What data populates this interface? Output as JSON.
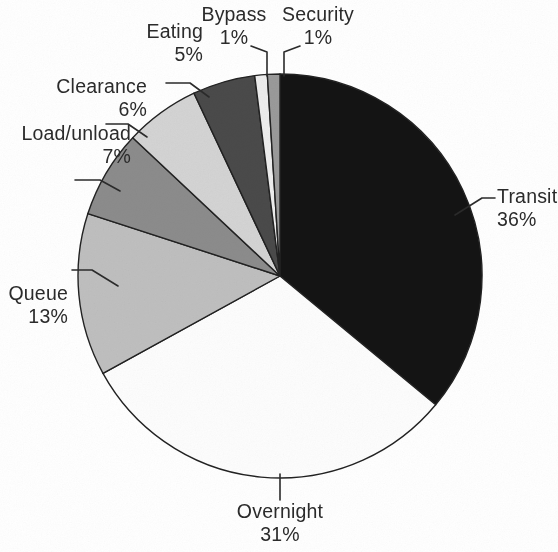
{
  "figure": {
    "type": "pie-chart-figure",
    "background_color": "#ffffff",
    "outline_color": "#222222"
  },
  "chart_data": {
    "type": "pie",
    "title": "",
    "subtitle": "",
    "xlabel": "",
    "ylabel": "",
    "legend_position": "none",
    "grid": false,
    "units": "percent",
    "start_angle_deg": 0,
    "direction": "clockwise",
    "total": 100,
    "categories": [
      "Transit",
      "Overnight",
      "Queue",
      "Load/unload",
      "Clearance",
      "Eating",
      "Bypass",
      "Security"
    ],
    "values": [
      36,
      31,
      13,
      7,
      6,
      5,
      1,
      1
    ],
    "slices": [
      {
        "label": "Transit",
        "value": 36,
        "value_text": "36%",
        "color": "#141414",
        "start_deg": 0,
        "end_deg": 129.6,
        "label_position": "right",
        "label_x": 496,
        "label_y": 198
      },
      {
        "label": "Overnight",
        "value": 31,
        "value_text": "31%",
        "color": "#fdfdfd",
        "start_deg": 129.6,
        "end_deg": 241.2,
        "label_position": "bottom",
        "label_x": 280,
        "label_y": 505
      },
      {
        "label": "Queue",
        "value": 13,
        "value_text": "13%",
        "color": "#bfbfbf",
        "start_deg": 241.2,
        "end_deg": 288.0,
        "label_position": "left",
        "label_x": 66,
        "label_y": 288
      },
      {
        "label": "Load/unload",
        "value": 7,
        "value_text": "7%",
        "color": "#8c8c8c",
        "start_deg": 288.0,
        "end_deg": 313.2,
        "label_position": "left",
        "label_x": 131,
        "label_y": 124
      },
      {
        "label": "Clearance",
        "value": 6,
        "value_text": "6%",
        "color": "#d4d4d4",
        "start_deg": 313.2,
        "end_deg": 334.8,
        "label_position": "left",
        "label_x": 147,
        "label_y": 69
      },
      {
        "label": "Eating",
        "value": 5,
        "value_text": "5%",
        "color": "#4a4a4a",
        "start_deg": 334.8,
        "end_deg": 352.8,
        "label_position": "left",
        "label_x": 203,
        "label_y": 30
      },
      {
        "label": "Bypass",
        "value": 1,
        "value_text": "1%",
        "color": "#ededed",
        "start_deg": 352.8,
        "end_deg": 356.4,
        "label_position": "top",
        "label_x": 232,
        "label_y": 6
      },
      {
        "label": "Security",
        "value": 1,
        "value_text": "1%",
        "color": "#9a9a9a",
        "start_deg": 356.4,
        "end_deg": 360,
        "label_position": "top",
        "label_x": 309,
        "label_y": 6
      }
    ]
  },
  "geometry": {
    "center_x": 280,
    "center_y": 276,
    "radius": 202
  },
  "leaders": {
    "transit": "M 455 215 L 482 198 L 495 198",
    "overnight": "M 280 474 L 280 500",
    "queue": "M 118 286 L 92 270 L 72 270",
    "load_unload": "M 120 191 L 100 180 L 75 180",
    "clearance": "M 147 137 L 128 124 L 106 124",
    "eating": "M 209 97 L 190 83 L 166 83",
    "bypass": "M 267 76 L 267 52 L 251 46",
    "security": "M 284 76 L 284 52 L 300 46"
  }
}
